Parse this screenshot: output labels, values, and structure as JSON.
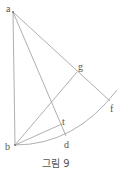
{
  "figure": {
    "caption": "그림 9",
    "points": {
      "a": {
        "label": "a",
        "x": 13,
        "y": 12
      },
      "b": {
        "label": "b",
        "x": 15,
        "y": 145
      },
      "g": {
        "label": "g",
        "x": 77,
        "y": 72
      },
      "f": {
        "label": "f",
        "x": 110,
        "y": 101
      },
      "d": {
        "label": "d",
        "x": 66,
        "y": 136
      },
      "t": {
        "label": "t",
        "x": 62,
        "y": 124
      }
    },
    "line_color": "#9a9a9a",
    "label_color": "#555555"
  }
}
